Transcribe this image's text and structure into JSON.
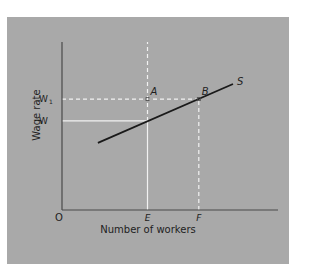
{
  "chart_data": {
    "type": "line",
    "title": "",
    "xlabel": "Number of workers",
    "ylabel": "Wage rate",
    "origin_label": "O",
    "xlim": [
      0,
      10
    ],
    "ylim": [
      0,
      10
    ],
    "grid": false,
    "x_ticks": [
      {
        "label": "E",
        "value": 5.0
      },
      {
        "label": "F",
        "value": 8.0
      }
    ],
    "y_ticks": [
      {
        "label": "W",
        "sub": "",
        "value": 5.3
      },
      {
        "label": "W",
        "sub": "1",
        "value": 6.6
      }
    ],
    "series": [
      {
        "name": "S",
        "points": [
          [
            2.1,
            4.0
          ],
          [
            10.0,
            7.5
          ]
        ]
      }
    ],
    "points": [
      {
        "label": "A",
        "x": 5.0,
        "y": 6.6
      },
      {
        "label": "B",
        "x": 8.0,
        "y": 6.6
      }
    ],
    "guides": [
      {
        "type": "vertical",
        "at": "E",
        "style": "solid",
        "from": 0,
        "to": 5.3
      },
      {
        "type": "vertical",
        "at": "E",
        "style": "dashed",
        "from": 5.3,
        "to": 10
      },
      {
        "type": "horizontal",
        "at": "W",
        "style": "solid",
        "from": 0,
        "to": 5.0
      },
      {
        "type": "horizontal",
        "at": "W1",
        "style": "dashed",
        "from": 0,
        "to": 8.0
      },
      {
        "type": "vertical",
        "at": "F",
        "style": "dashed",
        "from": 0,
        "to": 6.6
      }
    ]
  },
  "colors": {
    "panel": "#a9a9a9",
    "axis": "#4a4a4a",
    "supply_line": "#1a1a1a",
    "guide": "#f2f2f2",
    "text": "#1e1e1e"
  }
}
